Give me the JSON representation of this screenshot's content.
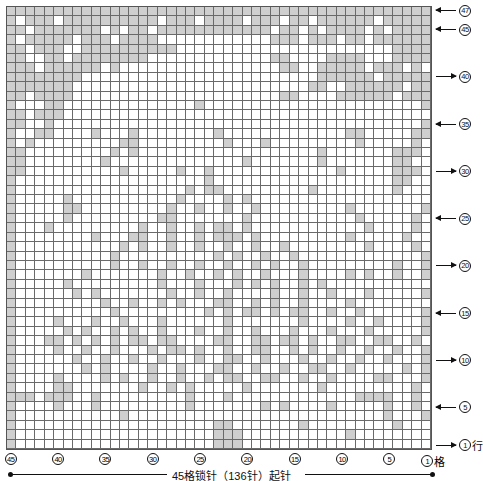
{
  "chart": {
    "columns": 45,
    "rows": 47,
    "fill_color": "#cfcfcf",
    "grid_line_color": "#6a6a6a",
    "pattern_rows_top_to_bottom": [
      "#############################################",
      "#.###.##########.###.####.###.##.######.#####",
      "##.#######.#.##.############.##.#.####.#.####",
      "#.#####.###.####............###.###.##.######",
      "##.###..##########.......................####",
      "##..##.########.............##....####...####",
      "###.######.#.................##..#####.###.#",
      "########.........................######.#####",
      "#######.........................##..######.##",
      "##.####......................##....######.###",
      "#...##..............#.......................#",
      "##.###.......................................",
      "##..#.......................................#",
      "#..##....#...#........#.............##.....##",
      "#.#.........##.........#...#.........#.....#",
      "##.........#.#...................#.......###",
      "##........#..............#.......#.......##.",
      "##..........#.....#..#.............#.....###",
      "#....................#...................##.",
      "#..................#.##.........#........#.",
      "#.....#...........#....#.#...................",
      "#.....##.........#..#..#..#.........#.......#",
      "#.....#.........##.......#...........#.....#",
      "#...#.........#..#..#.##.#............#....#",
      "#........#...##..#..#.###.#.........#.....#",
      "#...........#.#..#..#..#..#..#........#....#",
      "#..........#..........#.#..#..#.............#",
      "#..........#..#..#..#..#..#.#..#.........#..#",
      "#.......#.......#..#..#.#..#...#....#.#..#..#",
      "#.....#.........#...#...#.#.#..#.#...........#",
      "#......#.#.......#..#..#....#..#..#...#.....#",
      "#.........#..#..#.#...##..#.#..#....#........#",
      "#..........#.........#.#.##.#.##..#..#......#",
      "#....#...#..#...#......#.......#....#..#....#",
      "#.....#.#..#.#..#...#..#..#...#...#...#.....#",
      "#...##.#.#.#.##.##....##..##.##.#..##..##..#",
      "#....#..#..#...#.##.#..#..##..#.#..#..#..#..#",
      "#......#..#..#..#...#..##..#...#..#..#..#...#",
      "#.......#.#....#..#...##..#..#..##..#.....#.#",
      "#....#....#.#..#..#..#.##..##..#..#....##...#",
      "#....##.......#..#.#.....#.......#.........#",
      "###.###..#.........#...#.............####..#",
      "#....#...#.........#.......#.#....#.....#..#",
      "#...........#...........................#...#",
      "#.....................##.......#.........#...#",
      "#.....................###...........#........#",
      "#.....................###....................#"
    ]
  },
  "row_labels": [
    {
      "row": 47,
      "text": "47",
      "direction": "left",
      "suffix": ""
    },
    {
      "row": 45,
      "text": "45",
      "direction": "left",
      "suffix": ""
    },
    {
      "row": 40,
      "text": "40",
      "direction": "right",
      "suffix": ""
    },
    {
      "row": 35,
      "text": "35",
      "direction": "left",
      "suffix": ""
    },
    {
      "row": 30,
      "text": "30",
      "direction": "right",
      "suffix": ""
    },
    {
      "row": 25,
      "text": "25",
      "direction": "left",
      "suffix": ""
    },
    {
      "row": 20,
      "text": "20",
      "direction": "right",
      "suffix": ""
    },
    {
      "row": 15,
      "text": "15",
      "direction": "left",
      "suffix": ""
    },
    {
      "row": 10,
      "text": "10",
      "direction": "right",
      "suffix": ""
    },
    {
      "row": 5,
      "text": "5",
      "direction": "left",
      "suffix": ""
    },
    {
      "row": 1,
      "text": "1",
      "direction": "right",
      "suffix": "行"
    }
  ],
  "column_labels": [
    {
      "col": 45,
      "text": "45",
      "suffix": ""
    },
    {
      "col": 40,
      "text": "40",
      "suffix": ""
    },
    {
      "col": 35,
      "text": "35",
      "suffix": ""
    },
    {
      "col": 30,
      "text": "30",
      "suffix": ""
    },
    {
      "col": 25,
      "text": "25",
      "suffix": ""
    },
    {
      "col": 20,
      "text": "20",
      "suffix": ""
    },
    {
      "col": 15,
      "text": "15",
      "suffix": ""
    },
    {
      "col": 10,
      "text": "10",
      "suffix": ""
    },
    {
      "col": 5,
      "text": "5",
      "suffix": ""
    },
    {
      "col": 1,
      "text": "1",
      "suffix": "格"
    }
  ],
  "bottom_caption": "45格锁针（136针）起针"
}
